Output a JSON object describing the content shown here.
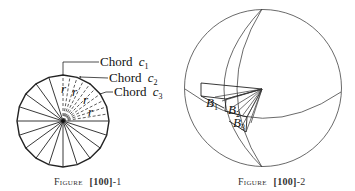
{
  "figure1": {
    "caption_word": "Figure",
    "caption_ref": "[100]",
    "caption_suffix": "-1",
    "chords": [
      {
        "label": "Chord",
        "var": "c",
        "sub": "1"
      },
      {
        "label": "Chord",
        "var": "c",
        "sub": "2"
      },
      {
        "label": "Chord",
        "var": "c",
        "sub": "3"
      }
    ],
    "radius_label": "r",
    "segment_count": 20
  },
  "figure2": {
    "caption_word": "Figure",
    "caption_ref": "[100]",
    "caption_suffix": "-2",
    "labels": [
      {
        "var": "B",
        "sub": "1"
      },
      {
        "var": "B",
        "sub": "2"
      },
      {
        "var": "B",
        "sub": "3"
      }
    ]
  }
}
